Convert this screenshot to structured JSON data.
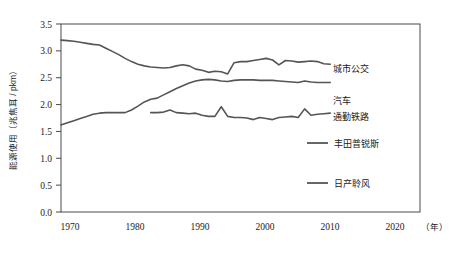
{
  "chart_data": {
    "type": "line",
    "title": "",
    "xlabel": "（年）",
    "ylabel": "能源使用（兆焦耳 / pkm）",
    "xlim": [
      1970,
      2026
    ],
    "ylim": [
      0.0,
      3.5
    ],
    "grid": false,
    "legend_position": "right",
    "xticks": [
      "1970",
      "1980",
      "1990",
      "2000",
      "2010",
      "2020"
    ],
    "xtick_values": [
      1970,
      1980,
      1990,
      2000,
      2010,
      2020
    ],
    "yticks": [
      "0.0",
      "0.5",
      "1.0",
      "1.5",
      "2.0",
      "2.5",
      "3.0",
      "3.5"
    ],
    "ytick_values": [
      0.0,
      0.5,
      1.0,
      1.5,
      2.0,
      2.5,
      3.0,
      3.5
    ],
    "series": [
      {
        "name": "城市公交",
        "color": "#555555",
        "label_side": "right",
        "x": [
          1970,
          1971,
          1972,
          1973,
          1974,
          1975,
          1976,
          1977,
          1978,
          1979,
          1980,
          1981,
          1982,
          1983,
          1984,
          1985,
          1986,
          1987,
          1988,
          1989,
          1990,
          1991,
          1992,
          1993,
          1994,
          1995,
          1996,
          1997,
          1998,
          1999,
          2000,
          2001,
          2002,
          2003,
          2004,
          2005,
          2006,
          2007,
          2008,
          2009,
          2010,
          2011,
          2012
        ],
        "values": [
          3.2,
          3.19,
          3.18,
          3.16,
          3.14,
          3.12,
          3.11,
          3.05,
          2.99,
          2.93,
          2.86,
          2.8,
          2.75,
          2.72,
          2.7,
          2.69,
          2.68,
          2.69,
          2.72,
          2.74,
          2.72,
          2.66,
          2.64,
          2.6,
          2.62,
          2.61,
          2.57,
          2.78,
          2.8,
          2.8,
          2.82,
          2.84,
          2.86,
          2.83,
          2.74,
          2.82,
          2.81,
          2.79,
          2.8,
          2.81,
          2.8,
          2.76,
          2.75
        ]
      },
      {
        "name": "汽车",
        "color": "#555555",
        "label_side": "right",
        "x": [
          1970,
          1971,
          1972,
          1973,
          1974,
          1975,
          1976,
          1977,
          1978,
          1979,
          1980,
          1981,
          1982,
          1983,
          1984,
          1985,
          1986,
          1987,
          1988,
          1989,
          1990,
          1991,
          1992,
          1993,
          1994,
          1995,
          1996,
          1997,
          1998,
          1999,
          2000,
          2001,
          2002,
          2003,
          2004,
          2005,
          2006,
          2007,
          2008,
          2009,
          2010,
          2011,
          2012
        ],
        "values": [
          1.62,
          1.66,
          1.7,
          1.74,
          1.78,
          1.82,
          1.84,
          1.85,
          1.85,
          1.85,
          1.85,
          1.9,
          1.97,
          2.05,
          2.1,
          2.12,
          2.18,
          2.24,
          2.3,
          2.35,
          2.4,
          2.44,
          2.46,
          2.47,
          2.46,
          2.44,
          2.43,
          2.45,
          2.46,
          2.46,
          2.46,
          2.45,
          2.45,
          2.45,
          2.44,
          2.43,
          2.42,
          2.41,
          2.44,
          2.42,
          2.41,
          2.41,
          2.41
        ]
      },
      {
        "name": "通勤铁路",
        "color": "#555555",
        "label_side": "right",
        "x": [
          1984,
          1985,
          1986,
          1987,
          1988,
          1989,
          1990,
          1991,
          1992,
          1993,
          1994,
          1995,
          1996,
          1997,
          1998,
          1999,
          2000,
          2001,
          2002,
          2003,
          2004,
          2005,
          2006,
          2007,
          2008,
          2009,
          2010,
          2011,
          2012
        ],
        "values": [
          1.85,
          1.85,
          1.86,
          1.9,
          1.85,
          1.84,
          1.83,
          1.84,
          1.8,
          1.78,
          1.78,
          1.96,
          1.78,
          1.76,
          1.76,
          1.75,
          1.72,
          1.76,
          1.74,
          1.72,
          1.76,
          1.77,
          1.78,
          1.76,
          1.92,
          1.8,
          1.82,
          1.83,
          1.84
        ]
      }
    ],
    "legend_only": [
      {
        "name": "丰田普锐斯",
        "color": "#555555"
      },
      {
        "name": "日产聆风",
        "color": "#555555"
      }
    ]
  },
  "series_labels": {
    "urban_bus": "城市公交",
    "car": "汽车",
    "commuter_rail": "通勤铁路"
  },
  "legend": {
    "prius": "丰田普锐斯",
    "leaf": "日产聆风"
  },
  "axes": {
    "y_title": "能源使用（兆焦耳 / pkm）",
    "x_title": "（年）",
    "y_0": "0.0",
    "y_1": "0.5",
    "y_2": "1.0",
    "y_3": "1.5",
    "y_4": "2.0",
    "y_5": "2.5",
    "y_6": "3.0",
    "y_7": "3.5",
    "x_0": "1970",
    "x_1": "1980",
    "x_2": "1990",
    "x_3": "2000",
    "x_4": "2010",
    "x_5": "2020"
  }
}
